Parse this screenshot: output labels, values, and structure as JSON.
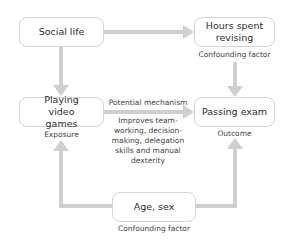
{
  "diagram": {
    "type": "causal-diagram",
    "nodes": {
      "social_life": {
        "label": "Social life"
      },
      "hours_revising": {
        "label": "Hours spent revising",
        "caption": "Confounding factor"
      },
      "video_games": {
        "label": "Playing video games",
        "caption": "Exposure"
      },
      "passing_exam": {
        "label": "Passing exam",
        "caption": "Outcome"
      },
      "age_sex": {
        "label": "Age, sex",
        "caption": "Confounding factor"
      }
    },
    "mechanism": {
      "title": "Potential mechanism",
      "description": "Improves team-working, decision-making, delegation skills and manual dexterity"
    },
    "edges": [
      {
        "from": "Social life",
        "to": "Hours spent revising"
      },
      {
        "from": "Social life",
        "to": "Playing video games"
      },
      {
        "from": "Hours spent revising",
        "to": "Passing exam"
      },
      {
        "from": "Playing video games",
        "to": "Passing exam",
        "label": "Potential mechanism"
      },
      {
        "from": "Age, sex",
        "to": "Playing video games"
      },
      {
        "from": "Age, sex",
        "to": "Passing exam"
      }
    ],
    "colors": {
      "arrow": "#cfcfcf",
      "box_border": "#d4d4d4",
      "text": "#333333"
    }
  }
}
